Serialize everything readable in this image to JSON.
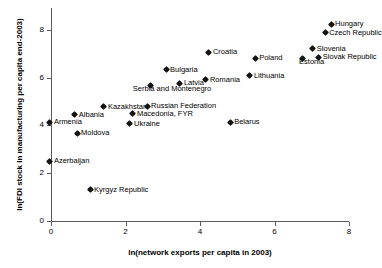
{
  "chart_data": {
    "type": "scatter",
    "title": "",
    "xlabel": "ln(network exports per capita in 2003)",
    "ylabel": "ln(FDI stock in manufacturing per capita end-2003)",
    "xlim": [
      -0.35,
      8.0
    ],
    "ylim": [
      -0.55,
      8.9
    ],
    "xticks": [
      0,
      2,
      4,
      6,
      8
    ],
    "yticks": [
      0,
      2,
      4,
      6,
      8
    ],
    "xticklabels": [
      "0",
      "2",
      "4",
      "6",
      "8"
    ],
    "yticklabels": [
      "0",
      "2",
      "4",
      "6",
      "8"
    ],
    "grid": false,
    "legend": false,
    "marker": "diamond",
    "marker_color": "#141414",
    "points": [
      {
        "label": "Armenia",
        "x": -0.03,
        "y": 4.14,
        "lx": 4,
        "ly": -2
      },
      {
        "label": "Albania",
        "x": 0.64,
        "y": 4.44,
        "lx": 4,
        "ly": -2
      },
      {
        "label": "Moldova",
        "x": 0.7,
        "y": 3.68,
        "lx": 4,
        "ly": -2
      },
      {
        "label": "Azerbaijan",
        "x": -0.03,
        "y": 2.51,
        "lx": 4,
        "ly": -2
      },
      {
        "label": "Kyrgyz Republic",
        "x": 1.05,
        "y": 1.3,
        "lx": 4,
        "ly": -2
      },
      {
        "label": "Kazakhstan",
        "x": 1.42,
        "y": 4.77,
        "lx": 4,
        "ly": -2
      },
      {
        "label": "Ukraine",
        "x": 2.12,
        "y": 4.06,
        "lx": 4,
        "ly": -2
      },
      {
        "label": "Macedonia, FYR",
        "x": 2.2,
        "y": 4.48,
        "lx": 4,
        "ly": -2
      },
      {
        "label": "Russian Federation",
        "x": 2.58,
        "y": 4.81,
        "lx": 4,
        "ly": -2
      },
      {
        "label": "Serbia and Montenegro",
        "x": 2.68,
        "y": 5.65,
        "lx": -18,
        "ly": 1
      },
      {
        "label": "Bulgaria",
        "x": 3.09,
        "y": 6.32,
        "lx": 4,
        "ly": -2
      },
      {
        "label": "Latvia",
        "x": 3.46,
        "y": 5.77,
        "lx": 4,
        "ly": -2
      },
      {
        "label": "Romania",
        "x": 4.16,
        "y": 5.9,
        "lx": 4,
        "ly": -2
      },
      {
        "label": "Croatia",
        "x": 4.24,
        "y": 7.07,
        "lx": 4,
        "ly": -2
      },
      {
        "label": "Belarus",
        "x": 4.81,
        "y": 4.14,
        "lx": 4,
        "ly": -2
      },
      {
        "label": "Lithuania",
        "x": 5.34,
        "y": 6.07,
        "lx": 4,
        "ly": -2
      },
      {
        "label": "Poland",
        "x": 5.48,
        "y": 6.82,
        "lx": 4,
        "ly": -2
      },
      {
        "label": "Estonia",
        "x": 6.74,
        "y": 6.82,
        "lx": -3,
        "ly": 2
      },
      {
        "label": "Slovenia",
        "x": 7.03,
        "y": 7.2,
        "lx": 4,
        "ly": -2
      },
      {
        "label": "Slovak Republic",
        "x": 7.19,
        "y": 6.86,
        "lx": 4,
        "ly": -2
      },
      {
        "label": "Czech Republic",
        "x": 7.36,
        "y": 7.87,
        "lx": 4,
        "ly": -2
      },
      {
        "label": "Hungary",
        "x": 7.52,
        "y": 8.24,
        "lx": 4,
        "ly": -2
      }
    ]
  }
}
